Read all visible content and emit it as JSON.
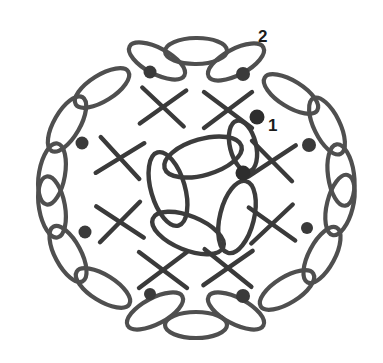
{
  "figure": {
    "background_color": "#ffffff",
    "stroke_color": "#4a4a4a",
    "node_color": "#3a3a3a",
    "label_color": "#1b1b1b",
    "width": 383,
    "height": 363,
    "center": {
      "x": 192,
      "y": 186
    }
  },
  "labels": [
    {
      "id": "label-1",
      "text": "1",
      "x": 268,
      "y": 131,
      "font_size": 17,
      "description": "label pointing to isolated filled circle marker"
    },
    {
      "id": "label-2",
      "text": "2",
      "x": 258,
      "y": 42,
      "font_size": 17,
      "description": "label pointing to outer ring ellipse"
    }
  ],
  "markers": [
    {
      "id": "marker-1",
      "name": "filled-dot-marker",
      "x": 257,
      "y": 117,
      "r": 7.5,
      "color": "#2e2e2e"
    }
  ],
  "core": {
    "name": "central-pinwheel",
    "center": {
      "x": 230,
      "y": 180
    },
    "hub": {
      "x": 243,
      "y": 173,
      "r": 7.5
    },
    "ellipse_count": 5,
    "ellipse_rx": 36,
    "ellipse_ry": 17,
    "orbit_radius": 34,
    "start_angle": -28,
    "ellipses": [
      {
        "cx": 200,
        "cy": 158,
        "rx": 37,
        "ry": 17,
        "rot": -18
      },
      {
        "cx": 166,
        "cy": 187,
        "rx": 37,
        "ry": 17,
        "rot": 72
      },
      {
        "cx": 185,
        "cy": 231,
        "rx": 37,
        "ry": 17,
        "rot": 20
      },
      {
        "cx": 236,
        "cy": 222,
        "rx": 37,
        "ry": 17,
        "rot": 100
      },
      {
        "cx": 245,
        "cy": 150,
        "rx": 27,
        "ry": 14,
        "rot": 78
      }
    ]
  },
  "crosses": {
    "name": "x-cross-motifs",
    "count": 10,
    "arm_length": 24,
    "items": [
      {
        "cx": 120,
        "cy": 158,
        "rot": 8
      },
      {
        "cx": 120,
        "cy": 222,
        "rot": -6
      },
      {
        "cx": 162,
        "cy": 107,
        "rot": 4
      },
      {
        "cx": 228,
        "cy": 110,
        "rot": 0
      },
      {
        "cx": 271,
        "cy": 161,
        "rot": 6
      },
      {
        "cx": 272,
        "cy": 224,
        "rot": -4
      },
      {
        "cx": 163,
        "cy": 271,
        "rot": 0
      },
      {
        "cx": 228,
        "cy": 268,
        "rot": 2
      }
    ]
  },
  "outer_ring": {
    "name": "outer-ellipse-ring",
    "symmetry": 5,
    "ring_radius": 118,
    "node_count": 10,
    "ellipse_count": 15,
    "nodes": [
      {
        "id": "node-top-left",
        "x": 150,
        "y": 72,
        "r": 6.5
      },
      {
        "id": "node-top-right",
        "x": 243,
        "y": 74,
        "r": 7.0
      },
      {
        "id": "node-right-upper",
        "x": 309,
        "y": 145,
        "r": 7.0
      },
      {
        "id": "node-right-lower",
        "x": 307,
        "y": 228,
        "r": 6.0
      },
      {
        "id": "node-bottom-right",
        "x": 243,
        "y": 296,
        "r": 7.0
      },
      {
        "id": "node-bottom-left",
        "x": 150,
        "y": 294,
        "r": 6.0
      },
      {
        "id": "node-left-lower",
        "x": 85,
        "y": 232,
        "r": 6.5
      },
      {
        "id": "node-left-upper",
        "x": 82,
        "y": 143,
        "r": 6.5
      }
    ]
  },
  "icons": {
    "ellipse_icon": "ellipse-outline",
    "node_icon": "filled-circle-node",
    "cross_icon": "x-cross"
  }
}
